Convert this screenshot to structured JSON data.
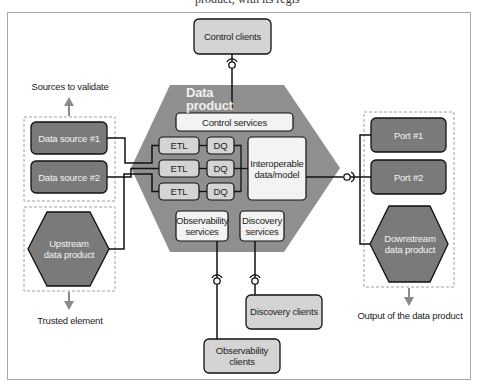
{
  "diagram": {
    "top_cut_text": "product, with its regis",
    "title": "Data product",
    "control_clients": "Control clients",
    "control_services": "Control services",
    "pipelines": [
      {
        "etl": "ETL",
        "dq": "DQ"
      },
      {
        "etl": "ETL",
        "dq": "DQ"
      },
      {
        "etl": "ETL",
        "dq": "DQ"
      }
    ],
    "interoperable": "Interoperable data/model",
    "observability_services": "Observability services",
    "discovery_services": "Discovery services",
    "discovery_clients": "Discovery clients",
    "observability_clients": "Observability clients",
    "left_group": {
      "caption_top": "Sources to validate",
      "data_source_1": "Data source #1",
      "data_source_2": "Data source #2",
      "upstream": "Upstream data product",
      "caption_bottom": "Trusted element"
    },
    "right_group": {
      "port_1": "Port #1",
      "port_2": "Port #2",
      "downstream": "Downstream data product",
      "caption_bottom": "Output of the data product"
    },
    "colors": {
      "hexagon_fill": "#8f8f8f",
      "dark_box": "#7a7a7a",
      "light_box": "#d4d4d4",
      "white_box": "#f3f3f3",
      "line": "#111111",
      "dashed": "#a0a0a0",
      "arrow": "#8a8a8a"
    }
  }
}
